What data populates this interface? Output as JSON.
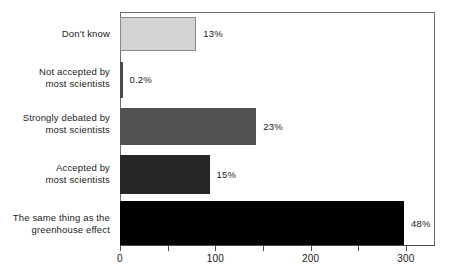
{
  "chart_data": {
    "type": "bar",
    "orientation": "horizontal",
    "title": "",
    "subtitle": "",
    "xlabel": "",
    "ylabel": "",
    "xlim": [
      0,
      330
    ],
    "grid": false,
    "legend": null,
    "categories": [
      "Don't know",
      "Not accepted by\nmost scientists",
      "Strongly debated by\nmost scientists",
      "Accepted by\nmost scientists",
      "The same thing as the\ngreenhouse effect"
    ],
    "values": [
      80,
      2,
      143,
      94,
      298
    ],
    "data_labels": [
      "13%",
      "0.2%",
      "23%",
      "15%",
      "48%"
    ],
    "bar_colors": [
      "#d3d3d3",
      "#4a4a4a",
      "#525252",
      "#262626",
      "#000000"
    ],
    "xticks": [
      0,
      50,
      100,
      150,
      200,
      250,
      300
    ],
    "xtick_labels": [
      "0",
      "",
      "100",
      "",
      "200",
      "",
      "300"
    ]
  },
  "axis": {
    "x_major_labels": [
      "0",
      "100",
      "200",
      "300"
    ]
  }
}
